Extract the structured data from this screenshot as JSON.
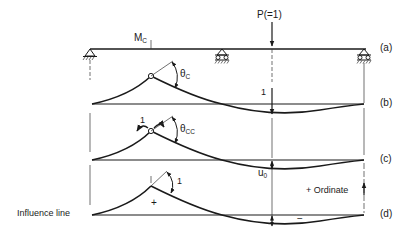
{
  "diagram": {
    "labels": {
      "moment": "M",
      "moment_sub": "C",
      "load": "P(=1)",
      "theta_c": "θ",
      "theta_c_sub": "C",
      "theta_cc": "θ",
      "theta_cc_sub": "CC",
      "unit_load_b": "1",
      "unit_moment_c": "1",
      "unit_rotation_d": "1",
      "u0": "u",
      "u0_sub": "0",
      "ordinate": "+ Ordinate",
      "influence_line": "Influence line",
      "plus_sign": "+",
      "minus_sign": "−"
    },
    "panels": [
      {
        "id": "a",
        "label": "(a)",
        "description": "Beam with pin support, interior roller and end roller; unit load P"
      },
      {
        "id": "b",
        "label": "(b)",
        "description": "Deflected shape with hinge at C, rotation θC"
      },
      {
        "id": "c",
        "label": "(c)",
        "description": "Unit couple at C, rotation θCC, deflection u0"
      },
      {
        "id": "d",
        "label": "(d)",
        "description": "Influence line for MC, unit rotation"
      }
    ],
    "supports": [
      "pin",
      "roller",
      "roller"
    ]
  }
}
